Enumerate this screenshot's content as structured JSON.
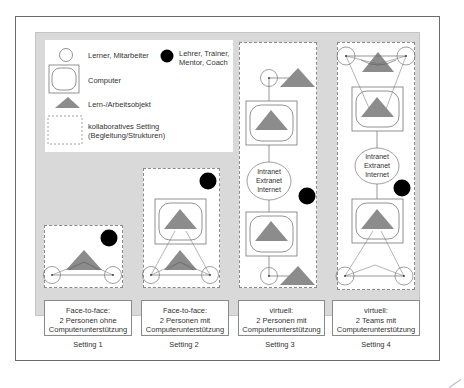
{
  "legend": {
    "learner": "Lerner, Mitarbeiter",
    "teacher_line1": "Lehrer, Trainer,",
    "teacher_line2": "Mentor, Coach",
    "computer": "Computer",
    "object": "Lern-/Arbeitsobjekt",
    "setting_line1": "kollaboratives Setting",
    "setting_line2": "(Begleitung/Strukturen)"
  },
  "network": {
    "line1": "Intranet",
    "line2": "Extranet",
    "line3": "Internet"
  },
  "settings": [
    {
      "label": "Setting 1",
      "caption": [
        "Face-to-face:",
        "2 Personen ohne",
        "Computerunterstützung"
      ]
    },
    {
      "label": "Setting 2",
      "caption": [
        "Face-to-face:",
        "2 Personen mit",
        "Computerunterstützung"
      ]
    },
    {
      "label": "Setting 3",
      "caption": [
        "virtuell:",
        "2 Personen mit",
        "Computerunterstützung"
      ]
    },
    {
      "label": "Setting 4",
      "caption": [
        "virtuell:",
        "2 Teams mit",
        "Computerunterstützung"
      ]
    }
  ],
  "colors": {
    "panel": "#d9d9d9",
    "object": "#8c8c8c",
    "teacher": "#000000",
    "lines": "#6b6b6b"
  }
}
